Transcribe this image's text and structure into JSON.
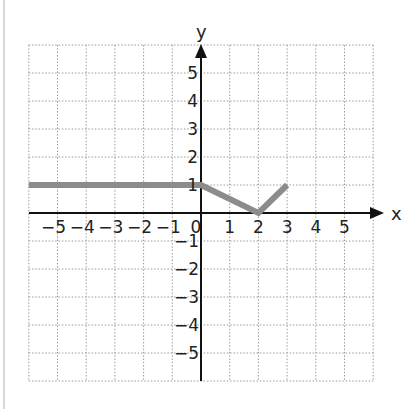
{
  "chart_data": {
    "type": "line",
    "title": "",
    "xlabel": "x",
    "ylabel": "y",
    "xlim": [
      -6,
      6
    ],
    "ylim": [
      -6,
      6
    ],
    "grid": true,
    "grid_style": "dotted",
    "x_ticks": [
      "-5",
      "-4",
      "-3",
      "-2",
      "-1",
      "0",
      "1",
      "2",
      "3",
      "4",
      "5"
    ],
    "y_ticks": [
      "5",
      "4",
      "3",
      "2",
      "1",
      "-1",
      "-2",
      "-3",
      "-4",
      "-5"
    ],
    "series": [
      {
        "name": "f(x)",
        "color": "#8c8c8c",
        "x": [
          -6,
          0,
          2,
          3
        ],
        "y": [
          1,
          1,
          0,
          1
        ]
      }
    ]
  },
  "labels": {
    "x_axis": "x",
    "y_axis": "y",
    "origin": "0",
    "x_ticks_neg": [
      "−5",
      "−4",
      "−3",
      "−2",
      "−1"
    ],
    "x_ticks_pos": [
      "1",
      "2",
      "3",
      "4",
      "5"
    ],
    "y_ticks_pos": [
      "5",
      "4",
      "3",
      "2",
      "1"
    ],
    "y_ticks_neg": [
      "−1",
      "−2",
      "−3",
      "−4",
      "−5"
    ]
  }
}
